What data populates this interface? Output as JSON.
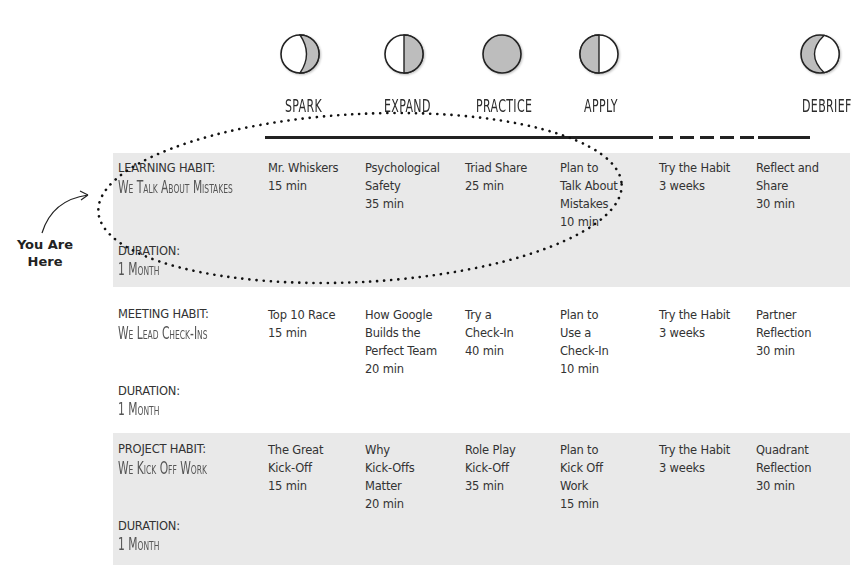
{
  "phases": [
    {
      "label": "SPARK",
      "icon": "waxing-crescent-moon-icon"
    },
    {
      "label": "EXPAND",
      "icon": "first-quarter-moon-icon"
    },
    {
      "label": "PRACTICE",
      "icon": "full-moon-icon"
    },
    {
      "label": "APPLY",
      "icon": "last-quarter-moon-icon"
    },
    {
      "label": "",
      "icon": ""
    },
    {
      "label": "DEBRIEF",
      "icon": "waning-crescent-moon-icon"
    }
  ],
  "annotation": {
    "you_are_here_line1": "You Are",
    "you_are_here_line2": "Here"
  },
  "habits": [
    {
      "type": "LEARNING HABIT:",
      "name": "We Talk About Mistakes",
      "duration_label": "DURATION:",
      "duration": "1 Month",
      "cells": [
        {
          "lines": [
            "Mr. Whiskers",
            "15 min"
          ]
        },
        {
          "lines": [
            "Psychological",
            "Safety",
            "35 min"
          ]
        },
        {
          "lines": [
            "Triad Share",
            "25 min"
          ]
        },
        {
          "lines": [
            "Plan to",
            "Talk About",
            "Mistakes",
            "10 min"
          ]
        },
        {
          "lines": [
            "Try the Habit",
            "3 weeks"
          ]
        },
        {
          "lines": [
            "Reflect and",
            "Share",
            "30 min"
          ]
        }
      ]
    },
    {
      "type": "MEETING HABIT:",
      "name": "We Lead Check-Ins",
      "duration_label": "DURATION:",
      "duration": "1 Month",
      "cells": [
        {
          "lines": [
            "Top 10 Race",
            "15 min"
          ]
        },
        {
          "lines": [
            "How Google",
            "Builds the",
            "Perfect Team",
            "20 min"
          ]
        },
        {
          "lines": [
            "Try a",
            "Check-In",
            "40 min"
          ]
        },
        {
          "lines": [
            "Plan to",
            "Use a",
            "Check-In",
            "10 min"
          ]
        },
        {
          "lines": [
            "Try the Habit",
            "3 weeks"
          ]
        },
        {
          "lines": [
            "Partner",
            "Reflection",
            "30 min"
          ]
        }
      ]
    },
    {
      "type": "PROJECT HABIT:",
      "name": "We Kick Off Work",
      "duration_label": "DURATION:",
      "duration": "1 Month",
      "cells": [
        {
          "lines": [
            "The Great",
            "Kick-Off",
            "15 min"
          ]
        },
        {
          "lines": [
            "Why",
            "Kick-Offs",
            "Matter",
            "20 min"
          ]
        },
        {
          "lines": [
            "Role Play",
            "Kick-Off",
            "35 min"
          ]
        },
        {
          "lines": [
            "Plan to",
            "Kick Off",
            "Work",
            "15 min"
          ]
        },
        {
          "lines": [
            "Try the Habit",
            "3 weeks"
          ]
        },
        {
          "lines": [
            "Quadrant",
            "Reflection",
            "30 min"
          ]
        }
      ]
    }
  ],
  "colors": {
    "row_shade": "#e9e9e9",
    "moon_fill": "#bdbdbd",
    "line": "#222222"
  }
}
